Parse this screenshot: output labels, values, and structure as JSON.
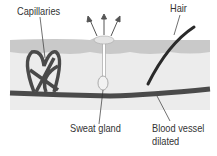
{
  "diagram": {
    "labels": {
      "capillaries": "Capillaries",
      "hair": "Hair",
      "sweat_gland": "Sweat gland",
      "blood_vessel_line1": "Blood vessel",
      "blood_vessel_line2": "dilated"
    },
    "colors": {
      "skin_top": "#c9c9c9",
      "dermis": "#ececec",
      "vessel": "#4a4a4a",
      "hair": "#2a2a2a",
      "text": "#333333"
    }
  }
}
